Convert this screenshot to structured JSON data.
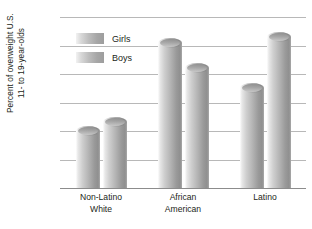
{
  "chart_data": {
    "type": "bar",
    "title": "",
    "xlabel": "",
    "ylabel": "Percent of overweight U.S. 11- to 19-year-olds",
    "ylabel_lines": [
      "Percent of overweight U.S.",
      "11- to 19-year-olds"
    ],
    "categories": [
      "Non-Latino White",
      "African American",
      "Latino"
    ],
    "category_lines": [
      [
        "Non-Latino",
        "White"
      ],
      [
        "African",
        "American"
      ],
      [
        "Latino"
      ]
    ],
    "series": [
      {
        "name": "Girls",
        "values": [
          10,
          25.5,
          17.5
        ]
      },
      {
        "name": "Boys",
        "values": [
          11.5,
          21,
          26.5
        ]
      }
    ],
    "ylim": [
      0,
      30
    ],
    "yticks": [
      0,
      5,
      10,
      15,
      20,
      25,
      30
    ],
    "ytick_labels": [
      "0",
      "5",
      "10",
      "15",
      "20",
      "25",
      "30"
    ],
    "grid": true,
    "legend": [
      "Girls",
      "Boys"
    ],
    "legend_position": "upper-left-inside",
    "colors": {
      "bar_light": "#e8e8e8",
      "bar_mid": "#b4b4b4",
      "bar_dark": "#8f8f8f",
      "grid": "#b8b8b8",
      "axis": "#8c8c8c",
      "text": "#231f20",
      "background": "#ffffff"
    }
  }
}
